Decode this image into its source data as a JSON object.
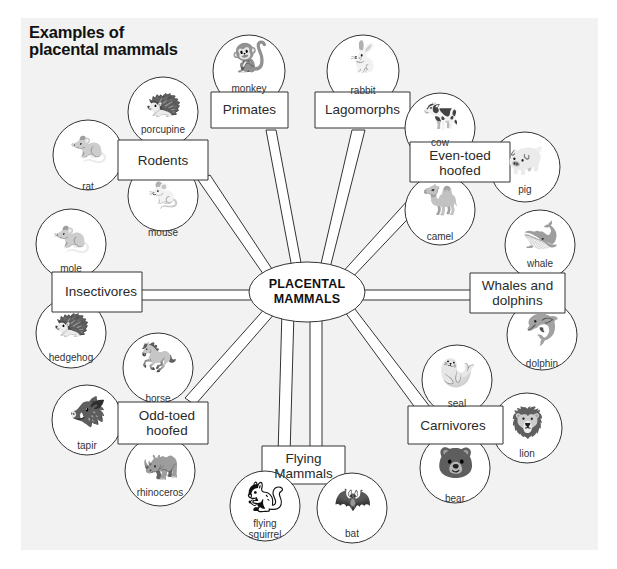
{
  "title": {
    "line1": "Examples of",
    "line2": "placental mammals"
  },
  "center": {
    "line1": "PLACENTAL",
    "line2": "MAMMALS"
  },
  "groups": [
    {
      "name": "Primates",
      "animals": [
        {
          "name": "monkey",
          "icon": "monkey-icon",
          "glyph": "🐒"
        }
      ]
    },
    {
      "name": "Lagomorphs",
      "animals": [
        {
          "name": "rabbit",
          "icon": "rabbit-icon",
          "glyph": "🐇"
        }
      ]
    },
    {
      "name_lines": [
        "Even-toed",
        "hoofed"
      ],
      "animals": [
        {
          "name": "cow",
          "icon": "cow-icon",
          "glyph": "🐄"
        },
        {
          "name": "pig",
          "icon": "pig-icon",
          "glyph": "🐖"
        },
        {
          "name": "camel",
          "icon": "camel-icon",
          "glyph": "🐪"
        }
      ]
    },
    {
      "name_lines": [
        "Whales and",
        "dolphins"
      ],
      "animals": [
        {
          "name": "whale",
          "icon": "whale-icon",
          "glyph": "🐋"
        },
        {
          "name": "dolphin",
          "icon": "dolphin-icon",
          "glyph": "🐬"
        }
      ]
    },
    {
      "name": "Carnivores",
      "animals": [
        {
          "name": "seal",
          "icon": "seal-icon",
          "glyph": "🦭"
        },
        {
          "name": "lion",
          "icon": "lion-icon",
          "glyph": "🦁"
        },
        {
          "name": "bear",
          "icon": "bear-icon",
          "glyph": "🐻"
        }
      ]
    },
    {
      "name_lines": [
        "Flying",
        "Mammals"
      ],
      "animals": [
        {
          "name_lines": [
            "flying",
            "squirrel"
          ],
          "icon": "flying-squirrel-icon",
          "glyph": "🐿"
        },
        {
          "name": "bat",
          "icon": "bat-icon",
          "glyph": "🦇"
        }
      ]
    },
    {
      "name_lines": [
        "Odd-toed",
        "hoofed"
      ],
      "animals": [
        {
          "name": "horse",
          "icon": "horse-icon",
          "glyph": "🐎"
        },
        {
          "name": "tapir",
          "icon": "tapir-icon",
          "glyph": "🐗"
        },
        {
          "name": "rhinoceros",
          "icon": "rhinoceros-icon",
          "glyph": "🦏"
        }
      ]
    },
    {
      "name": "Insectivores",
      "animals": [
        {
          "name": "mole",
          "icon": "mole-icon",
          "glyph": "🐀"
        },
        {
          "name": "hedgehog",
          "icon": "hedgehog-icon",
          "glyph": "🦔"
        }
      ]
    },
    {
      "name": "Rodents",
      "animals": [
        {
          "name": "porcupine",
          "icon": "porcupine-icon",
          "glyph": "🦔"
        },
        {
          "name": "rat",
          "icon": "rat-icon",
          "glyph": "🐀"
        },
        {
          "name": "mouse",
          "icon": "mouse-icon",
          "glyph": "🐁"
        }
      ]
    }
  ],
  "colors": {
    "background": "#f2f2f2",
    "shape_fill": "#ffffff",
    "stroke": "#333333",
    "text": "#222222"
  }
}
